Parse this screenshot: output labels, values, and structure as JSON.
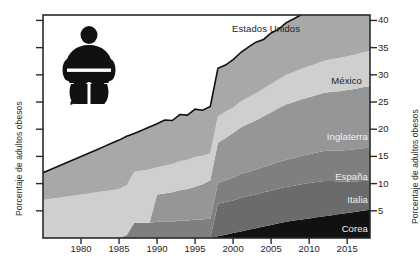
{
  "chart_data": {
    "type": "area",
    "title": "",
    "subtitle": "",
    "xlabel": "",
    "ylabel": "Porcentaje de adultos obesos",
    "ylabel_right": "Porcentaje de adultos obesos",
    "xlim": [
      1975,
      2018
    ],
    "ylim": [
      0,
      41
    ],
    "grid": false,
    "stacked": true,
    "legend_position": "inline-labels",
    "y_ticks": [
      5,
      10,
      15,
      20,
      25,
      30,
      35,
      40
    ],
    "y_tick_labels": [
      "5",
      "10",
      "15",
      "20",
      "25",
      "30",
      "35",
      "40"
    ],
    "y_ticks_left_unlabeled": [
      5,
      10,
      15,
      20,
      25,
      30,
      35,
      40
    ],
    "x_ticks": [
      1980,
      1985,
      1990,
      1995,
      2000,
      2005,
      2010,
      2015
    ],
    "x_tick_labels": [
      "1980",
      "1985",
      "1990",
      "1995",
      "2000",
      "2005",
      "2010",
      "2015"
    ],
    "x": [
      1975,
      1976,
      1977,
      1978,
      1979,
      1980,
      1981,
      1982,
      1983,
      1984,
      1985,
      1986,
      1987,
      1988,
      1989,
      1990,
      1991,
      1992,
      1993,
      1994,
      1995,
      1996,
      1997,
      1998,
      1999,
      2000,
      2001,
      2002,
      2003,
      2004,
      2005,
      2006,
      2007,
      2008,
      2009,
      2010,
      2011,
      2012,
      2013,
      2014,
      2015,
      2016,
      2017,
      2018
    ],
    "series": [
      {
        "name": "Corea",
        "color": "#111111",
        "label_color": "#f2f2f2",
        "values": [
          0,
          0,
          0,
          0,
          0,
          0,
          0,
          0,
          0,
          0,
          0,
          0,
          0,
          0,
          0,
          0,
          0,
          0,
          0,
          0,
          0,
          0,
          0,
          0.3,
          0.6,
          0.9,
          1.2,
          1.5,
          1.8,
          2.1,
          2.4,
          2.7,
          3.0,
          3.2,
          3.4,
          3.6,
          3.8,
          4.0,
          4.2,
          4.4,
          4.6,
          4.8,
          5.0,
          5.2
        ]
      },
      {
        "name": "Italia",
        "color": "#6b6b6b",
        "label_color": "#f2f2f2",
        "values": [
          0,
          0,
          0,
          0,
          0,
          0,
          0,
          0,
          0,
          0,
          0,
          0,
          0,
          0,
          0,
          0,
          0,
          0,
          0,
          0,
          0,
          0,
          0,
          6.0,
          6.0,
          6.0,
          6.2,
          6.2,
          6.2,
          6.3,
          6.3,
          6.4,
          6.4,
          6.4,
          6.5,
          6.5,
          6.5,
          6.5,
          6.3,
          6.0,
          5.8,
          5.6,
          5.5,
          5.4
        ]
      },
      {
        "name": "España",
        "color": "#7f7f7f",
        "label_color": "#f2f2f2",
        "values": [
          0,
          0,
          0,
          0,
          0,
          0,
          0,
          0,
          0,
          0,
          0,
          0.5,
          2.8,
          2.8,
          2.8,
          3.0,
          3.0,
          3.0,
          3.2,
          3.2,
          3.4,
          3.4,
          3.6,
          3.8,
          4.0,
          4.2,
          4.4,
          4.5,
          4.6,
          4.7,
          4.8,
          4.9,
          5.0,
          5.1,
          5.2,
          5.3,
          5.4,
          5.5,
          5.6,
          5.7,
          5.8,
          5.9,
          6.0,
          6.0
        ]
      },
      {
        "name": "Inglaterra",
        "color": "#969696",
        "label_color": "#f2f2f2",
        "values": [
          0,
          0,
          0,
          0,
          0,
          0,
          0,
          0,
          0,
          0,
          0,
          0,
          0,
          0,
          0,
          5.0,
          5.2,
          5.4,
          5.6,
          5.8,
          6.0,
          6.5,
          7.0,
          7.4,
          7.8,
          8.2,
          8.5,
          8.8,
          9.0,
          9.3,
          9.6,
          9.9,
          10.2,
          10.3,
          10.4,
          10.5,
          10.6,
          10.7,
          10.8,
          10.9,
          11.0,
          11.1,
          11.2,
          11.3
        ]
      },
      {
        "name": "México",
        "color": "#cfcfcf",
        "label_color": "#1d1d1d",
        "values": [
          7.0,
          7.2,
          7.4,
          7.6,
          7.8,
          8.0,
          8.2,
          8.4,
          8.6,
          8.8,
          9.0,
          9.2,
          9.4,
          9.6,
          9.8,
          5.0,
          5.1,
          5.2,
          5.3,
          5.4,
          5.5,
          5.2,
          5.0,
          4.9,
          4.8,
          4.7,
          4.8,
          4.9,
          5.0,
          5.1,
          5.2,
          5.3,
          5.4,
          5.5,
          5.6,
          5.7,
          5.8,
          5.9,
          6.0,
          6.1,
          6.2,
          6.3,
          6.4,
          6.5
        ]
      },
      {
        "name": "Estados Unidos",
        "color": "#a8a8a8",
        "label_color": "#1d1d1d",
        "values": [
          5.0,
          5.4,
          5.8,
          6.2,
          6.6,
          7.0,
          7.4,
          7.8,
          8.2,
          8.6,
          9.0,
          9.0,
          7.0,
          7.4,
          7.8,
          8.0,
          8.4,
          8.0,
          8.6,
          8.2,
          8.8,
          8.4,
          8.6,
          8.8,
          8.6,
          8.8,
          9.0,
          9.2,
          9.4,
          9.0,
          9.4,
          9.2,
          9.6,
          9.8,
          10.0,
          10.2,
          10.4,
          10.6,
          10.8,
          11.0,
          11.2,
          11.4,
          11.6,
          11.8
        ]
      }
    ],
    "annotations": [
      {
        "name": "Estados Unidos",
        "x_px": 300,
        "y_px": 28,
        "anchor": "end",
        "style": "dark"
      },
      {
        "name": "México",
        "x_px": 362,
        "y_px": 80,
        "anchor": "end",
        "style": "dark"
      },
      {
        "name": "Inglaterra",
        "x_px": 368,
        "y_px": 136,
        "anchor": "end",
        "style": "light"
      },
      {
        "name": "España",
        "x_px": 368,
        "y_px": 176,
        "anchor": "end",
        "style": "light"
      },
      {
        "name": "Italia",
        "x_px": 368,
        "y_px": 199,
        "anchor": "end",
        "style": "light"
      },
      {
        "name": "Corea",
        "x_px": 368,
        "y_px": 228,
        "anchor": "end",
        "style": "light"
      }
    ]
  },
  "decoration": {
    "pictogram_name": "obese-person-pictogram",
    "pictogram_color": "#111111"
  },
  "colors": {
    "frame": "#2a2a2a",
    "background": "#ffffff",
    "text": "#1e1e1e"
  }
}
